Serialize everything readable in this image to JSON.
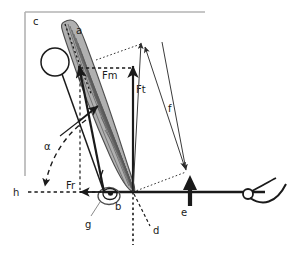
{
  "figure": {
    "background_color": "#ffffff",
    "frame": {
      "name": "panel-border",
      "color": "#b3b3b3",
      "top_edge": true,
      "left_edge": true
    },
    "colors": {
      "ink": "#1a1a1a",
      "muscle_fill": "#b0b0b0",
      "muscle_edge": "#4d4d4d",
      "frame_gray": "#b3b3b3",
      "bone_line": "#1a1a1a",
      "dotted_construction": "#333333"
    }
  },
  "labels": {
    "panel": {
      "name": "panel-letter",
      "text": "c"
    },
    "muscle": {
      "name": "muscle-label",
      "text": "a"
    },
    "joint": {
      "name": "joint-label",
      "text": "b"
    },
    "joint_detail": {
      "name": "joint-detail-label",
      "text": "g"
    },
    "vertical_axis": {
      "name": "vertical-reference-label",
      "text": "d"
    },
    "load_arrow": {
      "name": "load-arrow-label",
      "text": "e"
    },
    "moment_arm": {
      "name": "moment-arm-label",
      "text": "f"
    },
    "horizontal_axis": {
      "name": "horizontal-reference-label",
      "text": "h"
    },
    "angle": {
      "name": "pennation-angle-label",
      "text": "α"
    }
  },
  "vectors": {
    "muscle_force": {
      "name": "muscle-force-vector",
      "text": "Fm",
      "description": "muscle force along fiber direction",
      "from": [
        104,
        192
      ],
      "to": [
        79,
        68
      ]
    },
    "tendon_force": {
      "name": "tendon-force-vector",
      "text": "Ft",
      "description": "tendon force vertical component",
      "from": [
        133,
        192
      ],
      "to": [
        133,
        68
      ]
    },
    "reaction_force": {
      "name": "reaction-force-vector",
      "text": "Fr",
      "description": "horizontal reaction force",
      "from": [
        104,
        192
      ],
      "to": [
        79,
        192
      ]
    },
    "resultant": {
      "name": "resultant-force-vector",
      "description": "resultant vector toward upper right",
      "from": [
        133,
        192
      ],
      "to": [
        141,
        44
      ]
    },
    "load": {
      "name": "external-load-vector",
      "text": "e",
      "description": "upward external load arrow",
      "from": [
        190,
        205
      ],
      "to": [
        190,
        178
      ]
    }
  },
  "geometry": {
    "bone_long_axis": {
      "name": "long-bone-axis",
      "from": [
        133,
        192
      ],
      "to": [
        265,
        192
      ]
    },
    "proximal_bone": {
      "name": "proximal-bone-segment",
      "circle_center": [
        55,
        62
      ],
      "circle_radius": 14,
      "to": [
        104,
        192
      ]
    },
    "vertical_dotted": {
      "name": "vertical-reference-line",
      "from": [
        133,
        192
      ],
      "to": [
        133,
        245
      ]
    },
    "horizontal_dashed": {
      "name": "horizontal-reference-line",
      "from": [
        25,
        192
      ],
      "to": [
        104,
        192
      ]
    },
    "moment_arm_line": {
      "name": "moment-arm-measure",
      "from": [
        145,
        47
      ],
      "to": [
        185,
        168
      ]
    },
    "grip": {
      "name": "hand-grip",
      "center": [
        248,
        194
      ],
      "radius": 5
    }
  },
  "annotations": {
    "construction_lines": "dotted parallelogram connecting vector tips",
    "angle_arc": "dashed arc from pennation direction to horizontal"
  }
}
